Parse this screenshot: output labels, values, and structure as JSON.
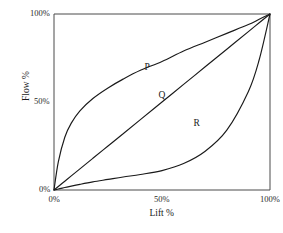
{
  "chart_data": {
    "type": "line",
    "title": "",
    "xlabel": "Lift %",
    "ylabel": "Flow %",
    "xlim": [
      0,
      100
    ],
    "ylim": [
      0,
      100
    ],
    "grid": false,
    "legend_position": "inline-annotations",
    "x_ticks": [
      {
        "value": 0,
        "label": "0%"
      },
      {
        "value": 50,
        "label": "50%"
      },
      {
        "value": 100,
        "label": "100%"
      }
    ],
    "y_ticks": [
      {
        "value": 0,
        "label": "0%"
      },
      {
        "value": 50,
        "label": "50%"
      },
      {
        "value": 100,
        "label": "100%"
      }
    ],
    "x": [
      0,
      2,
      5,
      8,
      12,
      18,
      25,
      32,
      40,
      50,
      60,
      70,
      80,
      90,
      95,
      100
    ],
    "series": [
      {
        "name": "P",
        "annotation": "P",
        "values": [
          0,
          16,
          30,
          38,
          45,
          52,
          58,
          63,
          68,
          73,
          79,
          84,
          89,
          94,
          97,
          100
        ]
      },
      {
        "name": "Q",
        "annotation": "Q",
        "values": [
          0,
          2,
          5,
          8,
          12,
          18,
          25,
          32,
          40,
          50,
          60,
          70,
          80,
          90,
          95,
          100
        ]
      },
      {
        "name": "R",
        "annotation": "R",
        "values": [
          0,
          0.6,
          1.4,
          2.2,
          3.2,
          4.6,
          6.0,
          7.4,
          8.8,
          11.0,
          15.0,
          22.0,
          34.0,
          56.0,
          74.0,
          100
        ]
      }
    ],
    "annotations": [
      {
        "text": "P",
        "x": 43,
        "y": 69
      },
      {
        "text": "Q",
        "x": 50,
        "y": 53
      },
      {
        "text": "R",
        "x": 66,
        "y": 37
      }
    ],
    "colors": {
      "line": "#1a1a1a",
      "axis": "#4a4a4a",
      "background": "#ffffff"
    }
  }
}
